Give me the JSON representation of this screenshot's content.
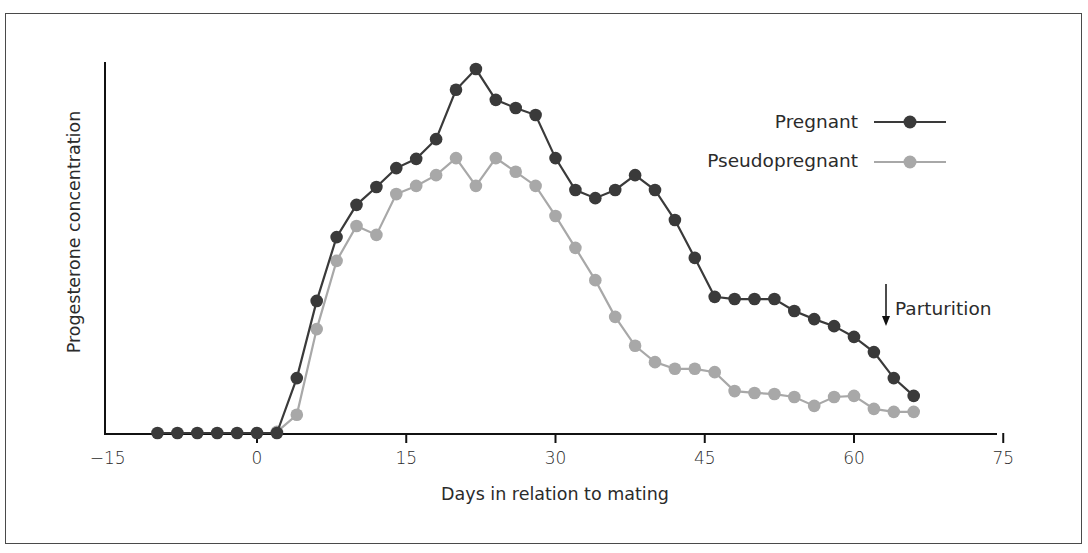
{
  "chart_data": {
    "type": "line",
    "title": "",
    "xlabel": "Days in relation to mating",
    "ylabel": "Progesterone concentration",
    "xlim": [
      -15,
      75
    ],
    "ylim": [
      0,
      100
    ],
    "y_units_note": "relative (no y tick labels shown)",
    "x_ticks": [
      -15,
      0,
      15,
      30,
      45,
      60,
      75
    ],
    "x_tick_labels": [
      "−15",
      "0",
      "15",
      "30",
      "45",
      "60",
      "75"
    ],
    "grid": false,
    "legend_position": "upper right",
    "x": [
      -10,
      -8,
      -6,
      -4,
      -2,
      0,
      2,
      4,
      6,
      8,
      10,
      12,
      14,
      16,
      18,
      20,
      22,
      24,
      26,
      28,
      30,
      32,
      34,
      36,
      38,
      40,
      42,
      44,
      46,
      48,
      50,
      52,
      54,
      56,
      58,
      60,
      62,
      64,
      66
    ],
    "series": [
      {
        "name": "Pregnant",
        "color": "#3a3a3a",
        "x": [
          -10,
          -8,
          -6,
          -4,
          -2,
          0,
          2,
          4,
          6,
          8,
          10,
          12,
          14,
          16,
          18,
          20,
          22,
          24,
          26,
          28,
          30,
          32,
          34,
          36,
          38,
          40,
          42,
          44,
          46,
          48,
          50,
          52,
          54,
          56,
          58,
          60,
          62,
          64,
          66
        ],
        "values": [
          0,
          0,
          0,
          0,
          0,
          0,
          0,
          14.8,
          35.6,
          52.8,
          61.5,
          66.3,
          71.4,
          73.9,
          79.2,
          92.5,
          98.1,
          89.8,
          87.6,
          85.7,
          74.1,
          65.5,
          63.3,
          65.5,
          69.5,
          65.5,
          57.4,
          47.2,
          36.7,
          36.1,
          36.1,
          36.1,
          32.9,
          30.7,
          28.8,
          25.9,
          21.8,
          14.8,
          10.0
        ]
      },
      {
        "name": "Pseudopregnant",
        "color": "#a8a8a8",
        "x": [
          2,
          4,
          6,
          8,
          10,
          12,
          14,
          16,
          18,
          20,
          22,
          24,
          26,
          28,
          30,
          32,
          34,
          36,
          38,
          40,
          42,
          44,
          46,
          48,
          50,
          52,
          54,
          56,
          58,
          60,
          62,
          64,
          66
        ],
        "values": [
          0.3,
          4.9,
          28.0,
          46.4,
          55.8,
          53.4,
          64.4,
          66.6,
          69.5,
          74.1,
          66.6,
          74.1,
          70.4,
          66.6,
          58.5,
          49.9,
          41.2,
          31.3,
          23.5,
          19.1,
          17.3,
          17.3,
          16.4,
          11.3,
          10.8,
          10.5,
          9.7,
          7.3,
          9.7,
          10.0,
          6.5,
          5.7,
          5.7
        ]
      }
    ],
    "annotations": [
      {
        "text": "Parturition",
        "arrow": "down",
        "x": 63.5
      }
    ]
  },
  "legend": {
    "items": [
      {
        "label": "Pregnant",
        "color": "#3a3a3a"
      },
      {
        "label": "Pseudopregnant",
        "color": "#a8a8a8"
      }
    ]
  },
  "layout": {
    "plot_left_px": 257,
    "x_px_per_day": 9.95,
    "baseline_y_px": 433,
    "y_px_per_unit": 3.71
  }
}
